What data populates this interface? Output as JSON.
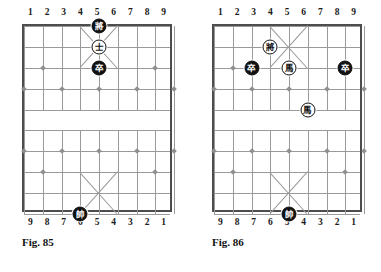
{
  "figures": [
    {
      "id": "fig-85",
      "caption": "Fig. 85",
      "top_file_labels": [
        "1",
        "2",
        "3",
        "4",
        "5",
        "6",
        "7",
        "8",
        "9"
      ],
      "bottom_file_labels": [
        "9",
        "8",
        "7",
        "6",
        "5",
        "4",
        "3",
        "2",
        "1"
      ],
      "pieces": [
        {
          "name": "black-general",
          "glyph": "將",
          "color": "black",
          "file": 5,
          "rank": 0
        },
        {
          "name": "white-advisor",
          "glyph": "士",
          "color": "white",
          "file": 5,
          "rank": 1
        },
        {
          "name": "black-pawn",
          "glyph": "卒",
          "color": "black",
          "file": 5,
          "rank": 2
        },
        {
          "name": "white-marshal",
          "glyph": "帥",
          "color": "black",
          "file": 4,
          "rank": 9
        }
      ]
    },
    {
      "id": "fig-86",
      "caption": "Fig. 86",
      "top_file_labels": [
        "1",
        "2",
        "3",
        "4",
        "5",
        "6",
        "7",
        "8",
        "9"
      ],
      "bottom_file_labels": [
        "9",
        "8",
        "7",
        "6",
        "5",
        "4",
        "3",
        "2",
        "1"
      ],
      "pieces": [
        {
          "name": "black-general",
          "glyph": "將",
          "color": "white",
          "file": 4,
          "rank": 1
        },
        {
          "name": "black-pawn-left",
          "glyph": "卒",
          "color": "black",
          "file": 3,
          "rank": 2
        },
        {
          "name": "white-horse-upper",
          "glyph": "馬",
          "color": "white",
          "file": 5,
          "rank": 2
        },
        {
          "name": "black-pawn-right",
          "glyph": "卒",
          "color": "black",
          "file": 8,
          "rank": 2
        },
        {
          "name": "white-horse-lower",
          "glyph": "馬",
          "color": "white",
          "file": 6,
          "rank": 4
        },
        {
          "name": "white-marshal",
          "glyph": "帥",
          "color": "black",
          "file": 5,
          "rank": 9
        }
      ]
    }
  ],
  "board": {
    "files": 9,
    "ranks": 10,
    "river_between_ranks": [
      4,
      5
    ],
    "star_points": [
      {
        "file": 2,
        "rank": 2
      },
      {
        "file": 8,
        "rank": 2
      },
      {
        "file": 1,
        "rank": 3
      },
      {
        "file": 3,
        "rank": 3
      },
      {
        "file": 5,
        "rank": 3
      },
      {
        "file": 7,
        "rank": 3
      },
      {
        "file": 9,
        "rank": 3
      },
      {
        "file": 1,
        "rank": 6
      },
      {
        "file": 3,
        "rank": 6
      },
      {
        "file": 5,
        "rank": 6
      },
      {
        "file": 7,
        "rank": 6
      },
      {
        "file": 9,
        "rank": 6
      },
      {
        "file": 2,
        "rank": 7
      },
      {
        "file": 8,
        "rank": 7
      }
    ],
    "colors": {
      "grid_line": "#9a9a9a",
      "border": "#4d4d4d",
      "star": "#8f8f8f",
      "piece_black_bg": "#111111",
      "piece_white_bg": "#ffffff",
      "text": "#111111",
      "page_bg": "#ffffff"
    }
  }
}
